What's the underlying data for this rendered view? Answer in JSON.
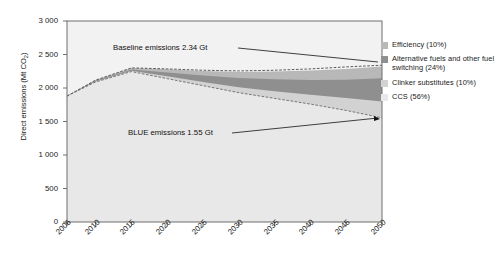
{
  "chart_data": {
    "type": "area",
    "title": "",
    "xlabel": "",
    "ylabel": "Direct emissions (Mt CO2)",
    "ylabel_prefix": "Direct emissions (Mt CO",
    "ylabel_sub": "2",
    "ylabel_suffix": ")",
    "ylim": [
      0,
      3000
    ],
    "ytick_labels": [
      "3 000",
      "2 500",
      "2 000",
      "1 500",
      "1 000",
      "500",
      "0"
    ],
    "ytick_values": [
      3000,
      2500,
      2000,
      1500,
      1000,
      500,
      0
    ],
    "xlim": [
      2006,
      2050
    ],
    "xtick_labels": [
      "2006",
      "2010",
      "2015",
      "2020",
      "2025",
      "2030",
      "2035",
      "2040",
      "2045",
      "2050"
    ],
    "xtick_values": [
      2006,
      2010,
      2015,
      2020,
      2025,
      2030,
      2035,
      2040,
      2045,
      2050
    ],
    "grid": false,
    "legend_position": "right",
    "x": [
      2006,
      2010,
      2015,
      2020,
      2025,
      2030,
      2035,
      2040,
      2045,
      2050
    ],
    "series": [
      {
        "name": "CCS (56%)",
        "color": "#e8e8e8",
        "values": [
          1880,
          2090,
          2245,
          2140,
          2035,
          1930,
          1845,
          1760,
          1665,
          1555
        ]
      },
      {
        "name": "Clinker substitutes (10%)",
        "color": "#d2d2d2",
        "values": [
          1880,
          2098,
          2257,
          2175,
          2090,
          2010,
          1950,
          1900,
          1850,
          1800
        ]
      },
      {
        "name": "Alternative fuels and other fuel switching (24%)",
        "color": "#8f8f8f",
        "values": [
          1880,
          2108,
          2277,
          2232,
          2185,
          2148,
          2130,
          2120,
          2125,
          2145
        ]
      },
      {
        "name": "Efficiency (10%)",
        "color": "#b8b8b8",
        "values": [
          1880,
          2118,
          2300,
          2280,
          2255,
          2240,
          2245,
          2260,
          2285,
          2320
        ]
      }
    ],
    "baseline_line": {
      "name": "Baseline emissions",
      "values": [
        1880,
        2118,
        2300,
        2285,
        2265,
        2255,
        2265,
        2285,
        2315,
        2340
      ]
    },
    "blue_line": {
      "name": "BLUE emissions",
      "values": [
        1880,
        2090,
        2245,
        2140,
        2035,
        1930,
        1845,
        1760,
        1665,
        1555
      ]
    },
    "annotations": [
      {
        "name": "baseline-annotation",
        "text": "Baseline emissions 2.34 Gt",
        "x": 2050,
        "y": 2340
      },
      {
        "name": "blue-annotation",
        "text": "BLUE emissions 1.55 Gt",
        "x": 2050,
        "y": 1555
      }
    ]
  },
  "legend": {
    "items": [
      {
        "label": "Efficiency (10%)",
        "color": "#b8b8b8"
      },
      {
        "label": "Alternative fuels and other fuel switching (24%)",
        "color": "#8f8f8f"
      },
      {
        "label": "Clinker substitutes (10%)",
        "color": "#d2d2d2"
      },
      {
        "label": "CCS (56%)",
        "color": "#e8e8e8"
      }
    ]
  },
  "colors": {
    "plot_background": "#f2f2f2",
    "axis": "#6e6e6e",
    "text": "#1a1a1a",
    "page_background": "#ffffff"
  }
}
